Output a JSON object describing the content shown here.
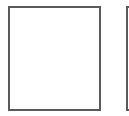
{
  "panels": [
    {
      "id": "left",
      "border_color": "#5a5a5a",
      "fill": "#ffffff"
    },
    {
      "id": "right",
      "border_color": "#5a5a5a",
      "fill": "#ffffff",
      "partially_visible": true
    }
  ]
}
